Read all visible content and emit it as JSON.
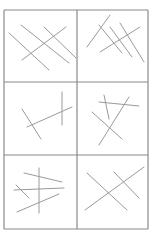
{
  "figure": {
    "colors": {
      "background": "#ffffff",
      "grid": "#8a8a8a",
      "segments": "#9a9a9a"
    },
    "grid": {
      "left": 4,
      "right": 148,
      "column_split": 77,
      "row_lines": [
        10,
        82,
        155,
        229
      ]
    },
    "panels": [
      {
        "id": "panel-1",
        "row": 1,
        "col": 1,
        "segments": [
          [
            9,
            33,
            49,
            70
          ],
          [
            21,
            25,
            69,
            63
          ],
          [
            44,
            27,
            76,
            58
          ],
          [
            22,
            60,
            66,
            27
          ]
        ]
      },
      {
        "id": "panel-2",
        "row": 1,
        "col": 2,
        "segments": [
          [
            87,
            47,
            110,
            15
          ],
          [
            99,
            25,
            122,
            53
          ],
          [
            110,
            27,
            132,
            57
          ],
          [
            120,
            23,
            144,
            62
          ],
          [
            100,
            52,
            140,
            27
          ]
        ]
      },
      {
        "id": "panel-3",
        "row": 2,
        "col": 1,
        "segments": [
          [
            22,
            109,
            41,
            139
          ],
          [
            27,
            127,
            72,
            107
          ],
          [
            62,
            92,
            62,
            125
          ]
        ]
      },
      {
        "id": "panel-4",
        "row": 2,
        "col": 2,
        "segments": [
          [
            99,
            102,
            139,
            106
          ],
          [
            104,
            95,
            109,
            119
          ],
          [
            129,
            97,
            99,
            145
          ],
          [
            92,
            112,
            122,
            139
          ]
        ]
      },
      {
        "id": "panel-5",
        "row": 3,
        "col": 1,
        "segments": [
          [
            24,
            173,
            62,
            182
          ],
          [
            39,
            168,
            39,
            213
          ],
          [
            14,
            190,
            64,
            188
          ],
          [
            16,
            185,
            29,
            198
          ],
          [
            17,
            212,
            59,
            194
          ]
        ]
      },
      {
        "id": "panel-6",
        "row": 3,
        "col": 2,
        "segments": [
          [
            87,
            173,
            127,
            210
          ],
          [
            85,
            210,
            144,
            167
          ],
          [
            114,
            172,
            139,
            198
          ]
        ]
      }
    ]
  }
}
